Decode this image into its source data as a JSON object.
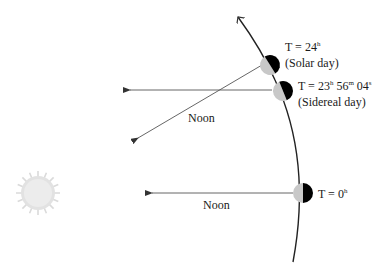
{
  "diagram": {
    "colors": {
      "line": "#333333",
      "earth_dark": "#000000",
      "earth_light": "#c8c8c8",
      "sun": "#dcdcdc"
    },
    "sun": {
      "label": "sun-icon"
    },
    "positions": [
      {
        "id": "t0",
        "time_label": "T = 0",
        "time_sup": "h",
        "noon_label": "Noon"
      },
      {
        "id": "sidereal",
        "time_label": "T = 23",
        "h": "h",
        "m_val": " 56",
        "m": "m",
        "s_val": " 04",
        "s": "s",
        "caption": "(Sidereal day)"
      },
      {
        "id": "solar",
        "time_label": "T = 24",
        "time_sup": "h",
        "caption": "(Solar day)",
        "noon_label": "Noon"
      }
    ]
  }
}
